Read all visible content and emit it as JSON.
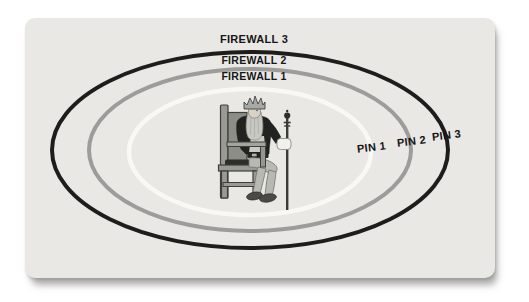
{
  "page": {
    "background": "#ffffff"
  },
  "card": {
    "background": "#e9e8e5"
  },
  "firewalls": [
    {
      "label": "FIREWALL 3",
      "color": "#1d1d1b"
    },
    {
      "label": "FIREWALL 2",
      "color": "#9c9c9a"
    },
    {
      "label": "FIREWALL 1",
      "color": "#f8f8f5"
    }
  ],
  "pins": [
    {
      "label": "PIN 1"
    },
    {
      "label": "PIN 2"
    },
    {
      "label": "PIN 3"
    }
  ],
  "figure": {
    "icon": "king-on-throne"
  }
}
